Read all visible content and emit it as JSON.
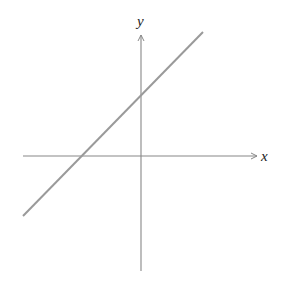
{
  "diagram": {
    "type": "coordinate-plane-line",
    "x_axis": {
      "label": "x",
      "from": [
        23,
        156
      ],
      "to": [
        256,
        156
      ]
    },
    "y_axis": {
      "label": "y",
      "from": [
        141,
        271
      ],
      "to": [
        141,
        36
      ]
    },
    "line": {
      "from": [
        23,
        216
      ],
      "to": [
        203,
        32
      ],
      "description": "straight line with positive slope, positive y-intercept, negative x-intercept"
    },
    "colors": {
      "axes": "#888888",
      "line": "#9a9a9a",
      "labels": "#222222",
      "background": "#ffffff"
    }
  }
}
